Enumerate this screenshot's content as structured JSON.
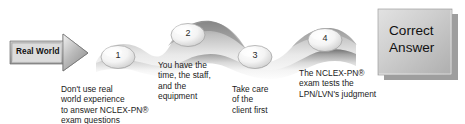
{
  "figure": {
    "background_color": "#ffffff",
    "text_color": "#1b1b1b"
  },
  "start_arrow": {
    "label": "Real World",
    "fill_color": "#b8b8b8",
    "text_color": "#101010"
  },
  "steps": [
    {
      "number": "1",
      "caption": "Don't use real\nworld experience\nto answer NCLEX-PN®\nexam questions"
    },
    {
      "number": "2",
      "caption": "You have the\ntime, the staff,\nand the\nequipment"
    },
    {
      "number": "3",
      "caption": "Take care\nof the\nclient first"
    },
    {
      "number": "4",
      "caption": "The NCLEX-PN®\nexam tests the\nLPN/LVN's judgment"
    }
  ],
  "result_box": {
    "label": "Correct\nAnswer",
    "fill_color": "#c4c4c4",
    "text_color": "#111111",
    "shadow_color": "#8d8d8d"
  },
  "ribbon": {
    "fill_light": "#fbfbfb",
    "fill_mid": "#c9c9c9",
    "fill_dark": "#9a9a9a"
  }
}
